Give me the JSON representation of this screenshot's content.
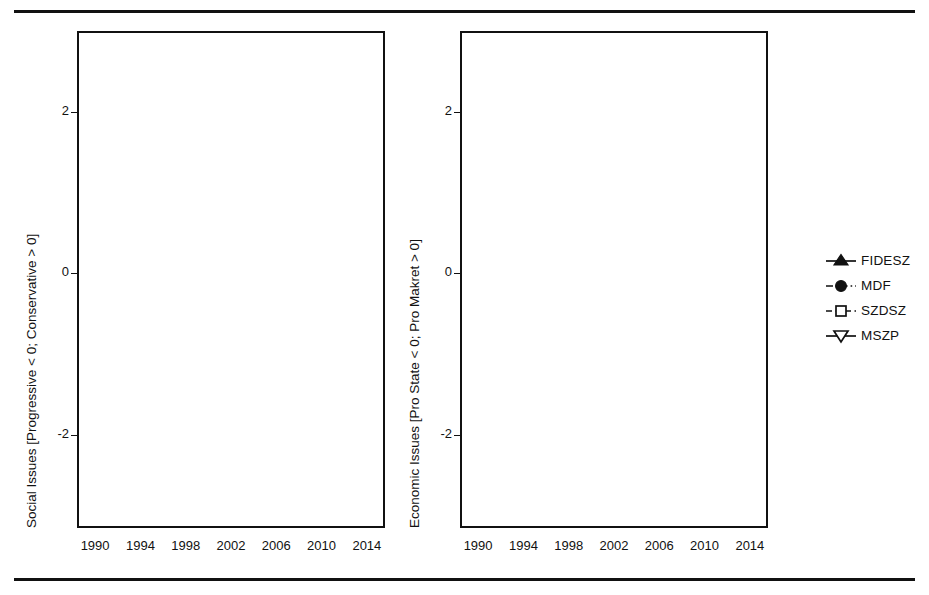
{
  "figure": {
    "top_rule": true,
    "bottom_rule": true
  },
  "legend": {
    "position": "right",
    "items": [
      {
        "label": "FIDESZ",
        "marker": "filled-triangle-up",
        "line": "solid"
      },
      {
        "label": "MDF",
        "marker": "filled-circle",
        "line": "dash-dot"
      },
      {
        "label": "SZDSZ",
        "marker": "open-square",
        "line": "dashed"
      },
      {
        "label": "MSZP",
        "marker": "open-triangle-down",
        "line": "solid"
      }
    ]
  },
  "chart_data": [
    {
      "type": "line",
      "panel": "left",
      "title": "",
      "xlabel": "",
      "ylabel": "Social Issues [Progressive < 0; Conservative > 0]",
      "x": [
        1990,
        1994,
        1998,
        2002,
        2006,
        2010,
        2014
      ],
      "xticklabels": [
        "1990",
        "1994",
        "1998",
        "2002",
        "2006",
        "2010",
        "2014"
      ],
      "yticks": [
        -2,
        0,
        2
      ],
      "yticklabels": [
        "-2",
        "0",
        "2"
      ],
      "ylim": [
        -3.15,
        3.0
      ],
      "xlim": [
        1988.4,
        2015.6
      ],
      "grid": true,
      "zero_line": true,
      "series": [
        {
          "name": "FIDESZ",
          "marker": "filled-triangle-up",
          "line": "solid",
          "x": [
            1990,
            1994,
            1998,
            2002,
            2006,
            2010,
            2014
          ],
          "values": [
            -1.82,
            -0.22,
            1.57,
            0.72,
            1.35,
            2.03,
            2.45
          ]
        },
        {
          "name": "MDF",
          "marker": "filled-circle",
          "line": "dash-dot",
          "x": [
            1990,
            1994,
            1998,
            2002,
            2006
          ],
          "values": [
            -0.65,
            0.02,
            1.15,
            1.47,
            2.0
          ]
        },
        {
          "name": "SZDSZ",
          "marker": "open-square",
          "line": "dashed",
          "x": [
            1990,
            1994,
            1998,
            2002,
            2006
          ],
          "values": [
            -2.85,
            -2.22,
            0.28,
            0.19,
            -0.21
          ]
        },
        {
          "name": "MSZP",
          "marker": "open-triangle-down",
          "line": "solid",
          "x": [
            1990,
            1994,
            1998,
            2002,
            2006,
            2010,
            2014
          ],
          "values": [
            -1.63,
            -0.25,
            1.13,
            1.6,
            0.45,
            0.55,
            0.48
          ]
        }
      ]
    },
    {
      "type": "line",
      "panel": "right",
      "title": "",
      "xlabel": "",
      "ylabel": "Economic Issues [Pro State < 0; Pro Makret > 0]",
      "x": [
        1990,
        1994,
        1998,
        2002,
        2006,
        2010,
        2014
      ],
      "xticklabels": [
        "1990",
        "1994",
        "1998",
        "2002",
        "2006",
        "2010",
        "2014"
      ],
      "yticks": [
        -2,
        0,
        2
      ],
      "yticklabels": [
        "-2",
        "0",
        "2"
      ],
      "ylim": [
        -3.15,
        3.0
      ],
      "xlim": [
        1988.4,
        2015.6
      ],
      "grid": true,
      "zero_line": true,
      "series": [
        {
          "name": "FIDESZ",
          "marker": "filled-triangle-up",
          "line": "solid",
          "x": [
            1990,
            1994,
            1998,
            2002,
            2006,
            2010,
            2014
          ],
          "values": [
            0.08,
            -0.17,
            -0.72,
            -1.08,
            -1.9,
            -1.99,
            -0.78
          ]
        },
        {
          "name": "MDF",
          "marker": "filled-circle",
          "line": "dash-dot",
          "x": [
            1990,
            1994,
            1998,
            2002,
            2006
          ],
          "values": [
            0.02,
            0.33,
            -0.3,
            -1.57,
            -0.4
          ]
        },
        {
          "name": "SZDSZ",
          "marker": "open-square",
          "line": "dashed",
          "x": [
            1990,
            1994,
            1998,
            2002,
            2006
          ],
          "values": [
            0.52,
            0.88,
            -0.65,
            -1.85,
            0.13
          ]
        },
        {
          "name": "MSZP",
          "marker": "open-triangle-down",
          "line": "solid",
          "x": [
            1990,
            1994,
            1998,
            2002,
            2006,
            2010,
            2014
          ],
          "values": [
            -0.27,
            -0.85,
            -1.22,
            -1.7,
            -1.47,
            -1.55,
            -1.58
          ]
        }
      ]
    }
  ]
}
